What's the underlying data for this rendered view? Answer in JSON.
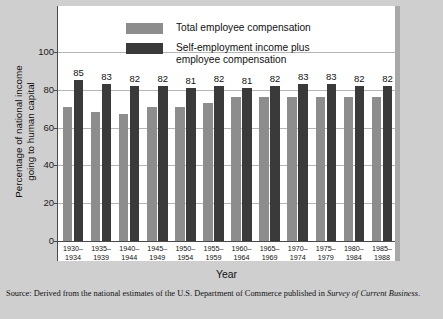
{
  "chart_data": {
    "type": "bar",
    "title": "",
    "xlabel": "Year",
    "ylabel": "Percentage of national income going to human capital",
    "ylim": [
      0,
      110
    ],
    "yticks": [
      0,
      20,
      40,
      60,
      80,
      100
    ],
    "grid": true,
    "legend_position": "top-center",
    "categories": [
      "1930–\n1934",
      "1935–\n1939",
      "1940–\n1944",
      "1945–\n1949",
      "1950–\n1954",
      "1955–\n1959",
      "1960–\n1964",
      "1965–\n1969",
      "1970–\n1974",
      "1975–\n1979",
      "1980–\n1984",
      "1985–\n1988"
    ],
    "series": [
      {
        "name": "Total employee compensation",
        "color": "#8d8d8d",
        "values": [
          71,
          68,
          67,
          71,
          71,
          73,
          76,
          76,
          76,
          76,
          76,
          76
        ],
        "labels": [
          "",
          "",
          "",
          "",
          "",
          "",
          "",
          "",
          "",
          "",
          "",
          ""
        ]
      },
      {
        "name": "Self-employment income plus employee compensation",
        "color": "#3a3a3a",
        "values": [
          85,
          83,
          82,
          82,
          81,
          82,
          81,
          82,
          83,
          83,
          82,
          82
        ],
        "labels": [
          "85",
          "83",
          "82",
          "82",
          "81",
          "82",
          "81",
          "82",
          "83",
          "83",
          "82",
          "82"
        ]
      }
    ]
  },
  "legend": {
    "items": [
      {
        "label": "Total employee compensation",
        "color": "#8d8d8d"
      },
      {
        "label": "Self-employment income plus\nemployee compensation",
        "color": "#3a3a3a"
      }
    ]
  },
  "axes": {
    "y_title": "Percentage of national income\ngoing to human capital",
    "x_title": "Year",
    "y_tick_labels": [
      "100",
      "80",
      "60",
      "40",
      "20",
      "0"
    ]
  },
  "source": {
    "prefix": "Source: Derived from the national estimates of the U.S. Department of Commerce published in ",
    "italic": "Survey of Current Business",
    "suffix": "."
  }
}
